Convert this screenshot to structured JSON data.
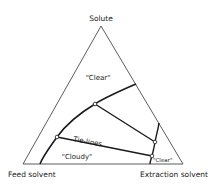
{
  "diagram": {
    "type": "ternary phase diagram",
    "vertices": {
      "top": "Solute",
      "bottom_left": "Feed solvent",
      "bottom_right": "Extraction solvent"
    },
    "region_labels": {
      "upper": "\"Clear\"",
      "lower_left": "\"Cloudy\"",
      "lower_right": "\"Clear\""
    },
    "tie_line_label": "Tie-lines",
    "colors": {
      "line": "#1a1a1a",
      "background": "#ffffff"
    }
  }
}
